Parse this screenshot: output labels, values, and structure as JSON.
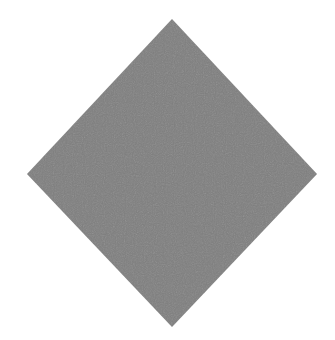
{
  "canvas": {
    "width": 335,
    "height": 340,
    "background": "#ffffff"
  },
  "shape": {
    "type": "diamond",
    "fill": "#7f7f7f",
    "texture": "dithered-noise",
    "points": "172,19 317,174 172,327 27,174"
  }
}
